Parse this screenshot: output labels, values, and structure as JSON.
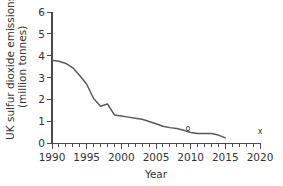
{
  "chart_data": {
    "type": "line",
    "title": "",
    "xlabel": "Year",
    "ylabel": "UK sulfur dioxide emissions (million tonnes)",
    "ylabel_line1": "UK sulfur dioxide emissions",
    "ylabel_line2": "(million tonnes)",
    "xlim": [
      1990,
      2020
    ],
    "ylim": [
      0,
      6
    ],
    "x_ticks_major": [
      1990,
      1995,
      2000,
      2005,
      2010,
      2015,
      2020
    ],
    "x_tick_labels": [
      "1990",
      "1995",
      "2000",
      "2005",
      "2010",
      "2015",
      "2020"
    ],
    "x_tick_minor_step": 1,
    "y_ticks": [
      0,
      1,
      2,
      3,
      4,
      5,
      6
    ],
    "y_tick_labels": [
      "0",
      "1",
      "2",
      "3",
      "4",
      "5",
      "6"
    ],
    "grid": false,
    "legend": null,
    "line_color": "#5a5a5a",
    "axis_color": "#4a4a4a",
    "series": [
      {
        "name": "UK sulfur dioxide emissions",
        "x": [
          1990,
          1991,
          1992,
          1993,
          1994,
          1995,
          1996,
          1997,
          1998,
          1999,
          2000,
          2001,
          2002,
          2003,
          2004,
          2005,
          2006,
          2007,
          2008,
          2009,
          2010,
          2011,
          2012,
          2013,
          2014,
          2015
        ],
        "values": [
          3.8,
          3.75,
          3.65,
          3.45,
          3.1,
          2.7,
          2.05,
          1.7,
          1.8,
          1.3,
          1.25,
          1.2,
          1.15,
          1.1,
          1.0,
          0.9,
          0.78,
          0.72,
          0.68,
          0.6,
          0.5,
          0.45,
          0.45,
          0.45,
          0.38,
          0.25
        ]
      }
    ],
    "annotations": [
      {
        "name": "marker-o",
        "text": "o",
        "x": 2009.6,
        "y": 0.55
      },
      {
        "name": "marker-x",
        "text": "x",
        "x": 2020.0,
        "y": 0.42
      }
    ]
  }
}
